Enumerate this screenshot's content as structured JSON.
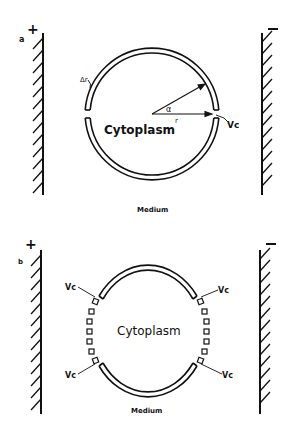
{
  "panel_a": {
    "label": "a",
    "anode_sign": "+",
    "cathode_sign": "−",
    "membrane_thickness_label": "Δr",
    "angle_label": "α",
    "radius_label": "r",
    "channel_label": "Vc",
    "interior_label": "Cytoplasm",
    "exterior_label": "Medium"
  },
  "panel_b": {
    "label": "b",
    "anode_sign": "+",
    "cathode_sign": "−",
    "channel_labels": [
      "Vc",
      "Vc",
      "Vc",
      "Vc"
    ],
    "interior_label": "Cytoplasm",
    "exterior_label": "Medium"
  },
  "colors": {
    "ink": "#111111",
    "background": "#ffffff"
  }
}
